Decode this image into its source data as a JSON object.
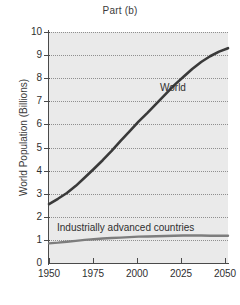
{
  "chart_data": {
    "type": "line",
    "title": "Part (b)",
    "xlabel": "Year",
    "ylabel": "World Population (Billions)",
    "xlim": [
      1950,
      2050
    ],
    "ylim": [
      0,
      10
    ],
    "grid": true,
    "grid_style": "dotted-horizontal",
    "legend": "inline-labels",
    "x_ticks": [
      1950,
      1975,
      2000,
      2025,
      2050
    ],
    "x_tick_labels": [
      "1950",
      "1975",
      "2000",
      "2025",
      "2050"
    ],
    "y_ticks": [
      0,
      1,
      2,
      3,
      4,
      5,
      6,
      7,
      8,
      9,
      10
    ],
    "y_tick_labels": [
      "0",
      "1",
      "2",
      "3",
      "4",
      "5",
      "6",
      "7",
      "8",
      "9",
      "10"
    ],
    "series": [
      {
        "name": "World",
        "color": "#3a3a3a",
        "label_position": "upper-right-of-curve",
        "x": [
          1950,
          1955,
          1960,
          1965,
          1970,
          1975,
          1980,
          1985,
          1990,
          1995,
          2000,
          2005,
          2010,
          2015,
          2020,
          2025,
          2030,
          2035,
          2040,
          2045,
          2050
        ],
        "values": [
          2.55,
          2.78,
          3.03,
          3.34,
          3.7,
          4.07,
          4.45,
          4.85,
          5.29,
          5.7,
          6.12,
          6.5,
          6.9,
          7.3,
          7.7,
          8.05,
          8.4,
          8.7,
          8.95,
          9.15,
          9.3
        ]
      },
      {
        "name": "Industrially advanced countries",
        "color": "#7d7d7d",
        "label_position": "above-line-left",
        "x": [
          1950,
          1955,
          1960,
          1965,
          1970,
          1975,
          1980,
          1985,
          1990,
          1995,
          2000,
          2005,
          2010,
          2015,
          2020,
          2025,
          2030,
          2035,
          2040,
          2045,
          2050
        ],
        "values": [
          0.85,
          0.88,
          0.92,
          0.96,
          1.0,
          1.03,
          1.06,
          1.08,
          1.1,
          1.12,
          1.14,
          1.15,
          1.16,
          1.17,
          1.18,
          1.19,
          1.19,
          1.19,
          1.18,
          1.18,
          1.18
        ]
      }
    ]
  },
  "colors": {
    "panel_background": "#eaeaea",
    "page_background": "#ffffff",
    "axis": "#4a4a4a",
    "gridline": "#8f8f8f",
    "world_series": "#3a3a3a",
    "iac_series": "#7d7d7d",
    "text": "#2f2f2f"
  }
}
